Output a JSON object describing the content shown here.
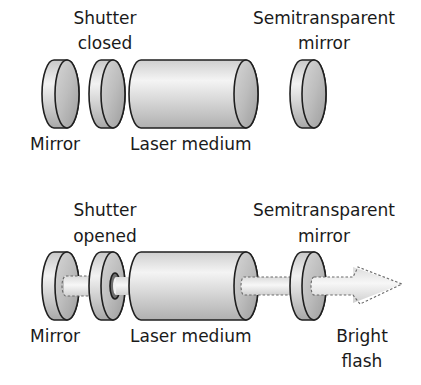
{
  "diagram": {
    "panels": [
      {
        "id": "closed",
        "labels": {
          "shutter_line1": "Shutter",
          "shutter_line2": "closed",
          "semi_line1": "Semitransparent",
          "semi_line2": "mirror",
          "mirror": "Mirror",
          "laser_medium": "Laser medium"
        }
      },
      {
        "id": "opened",
        "labels": {
          "shutter_line1": "Shutter",
          "shutter_line2": "opened",
          "semi_line1": "Semitransparent",
          "semi_line2": "mirror",
          "mirror": "Mirror",
          "laser_medium": "Laser medium",
          "flash_line1": "Bright",
          "flash_line2": "flash"
        }
      }
    ],
    "colors": {
      "background": "#ffffff",
      "outline": "#1f1f1f",
      "component_light": "#e6e6e6",
      "component_mid": "#c4c4c4",
      "component_dark": "#9a9a9a",
      "beam": "#ececec",
      "text": "#1a1a1a"
    }
  }
}
